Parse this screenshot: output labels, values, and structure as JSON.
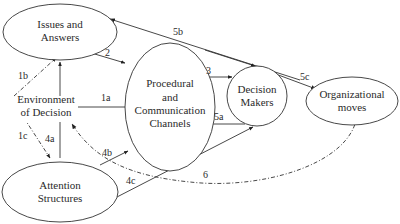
{
  "diagram": {
    "type": "flow-diagram",
    "nodes": {
      "issues": {
        "line1": "Issues and",
        "line2": "Answers"
      },
      "channels": {
        "line1": "Procedural",
        "line2": "and",
        "line3": "Communication",
        "line4": "Channels"
      },
      "decision_makers": {
        "line1": "Decision",
        "line2": "Makers"
      },
      "org_moves": {
        "line1": "Organizational",
        "line2": "moves"
      },
      "environment": {
        "line1": "Environment",
        "line2": "of Decision"
      },
      "attention": {
        "line1": "Attention",
        "line2": "Structures"
      }
    },
    "edges": [
      {
        "id": "1a",
        "label": "1a",
        "from": "Environment of Decision",
        "to": "Procedural and Communication Channels",
        "style": "solid"
      },
      {
        "id": "1b",
        "label": "1b",
        "from": "Environment of Decision",
        "to": "Issues and Answers",
        "style": "dash-dot"
      },
      {
        "id": "1c",
        "label": "1c",
        "from": "Environment of Decision",
        "to": "Attention Structures",
        "style": "dash-dot"
      },
      {
        "id": "2",
        "label": "2",
        "from": "Issues and Answers",
        "to": "Procedural and Communication Channels",
        "style": "solid"
      },
      {
        "id": "3",
        "label": "3",
        "from": "Procedural and Communication Channels",
        "to": "Decision Makers",
        "style": "solid"
      },
      {
        "id": "4a",
        "label": "4a",
        "from": "Attention Structures",
        "to": "Issues and Answers",
        "style": "solid"
      },
      {
        "id": "4b",
        "label": "4b",
        "from": "Attention Structures",
        "to": "Procedural and Communication Channels",
        "style": "solid"
      },
      {
        "id": "4c",
        "label": "4c",
        "from": "Attention Structures",
        "to": "Decision Makers",
        "style": "solid"
      },
      {
        "id": "5a",
        "label": "5a",
        "from": "Decision Makers",
        "to": "Procedural and Communication Channels",
        "style": "solid"
      },
      {
        "id": "5b",
        "label": "5b",
        "from": "Decision Makers",
        "to": "Issues and Answers",
        "style": "solid"
      },
      {
        "id": "5c",
        "label": "5c",
        "from": "Decision Makers",
        "to": "Organizational moves",
        "style": "solid"
      },
      {
        "id": "6",
        "label": "6",
        "from": "Organizational moves",
        "to": "Environment of Decision",
        "style": "dash-dot"
      }
    ]
  }
}
